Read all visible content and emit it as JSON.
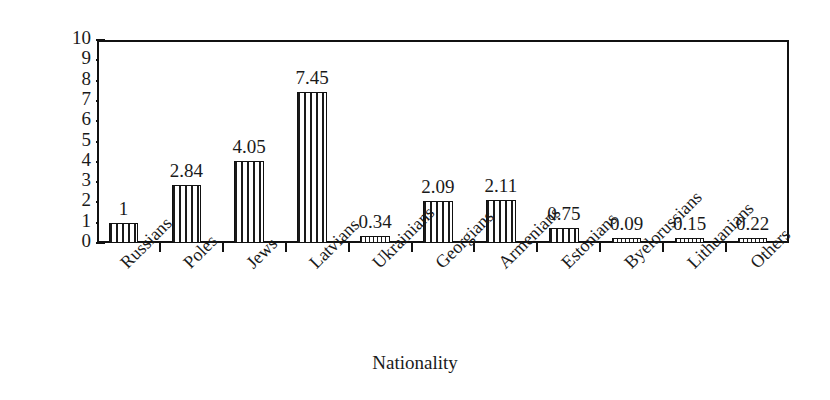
{
  "chart_data": {
    "type": "bar",
    "title": "",
    "xlabel": "Nationality",
    "ylabel": "Percentage",
    "categories": [
      "Russians",
      "Poles",
      "Jews",
      "Latvians",
      "Ukrainians",
      "Georgians",
      "Armenians",
      "Estonians",
      "Byelorussians",
      "Lithuanians",
      "Others"
    ],
    "values": [
      1,
      2.84,
      4.05,
      7.45,
      0.34,
      2.09,
      2.11,
      0.75,
      0.09,
      0.15,
      0.22
    ],
    "value_labels": [
      "1",
      "2.84",
      "4.05",
      "7.45",
      "0.34",
      "2.09",
      "2.11",
      "0.75",
      "0.09",
      "0.15",
      "0.22"
    ],
    "ylim": [
      0,
      10
    ],
    "ytick_labels": [
      "0",
      "1",
      "2",
      "3",
      "4",
      "5",
      "6",
      "7",
      "8",
      "9",
      "10"
    ],
    "grid": false,
    "legend": false,
    "bar_pattern": "vertical-hatch",
    "bar_edge_color": "#111111",
    "bar_fill_color": "#ffffff",
    "background_color": "#ffffff",
    "text_color": "#1a1a1a"
  }
}
